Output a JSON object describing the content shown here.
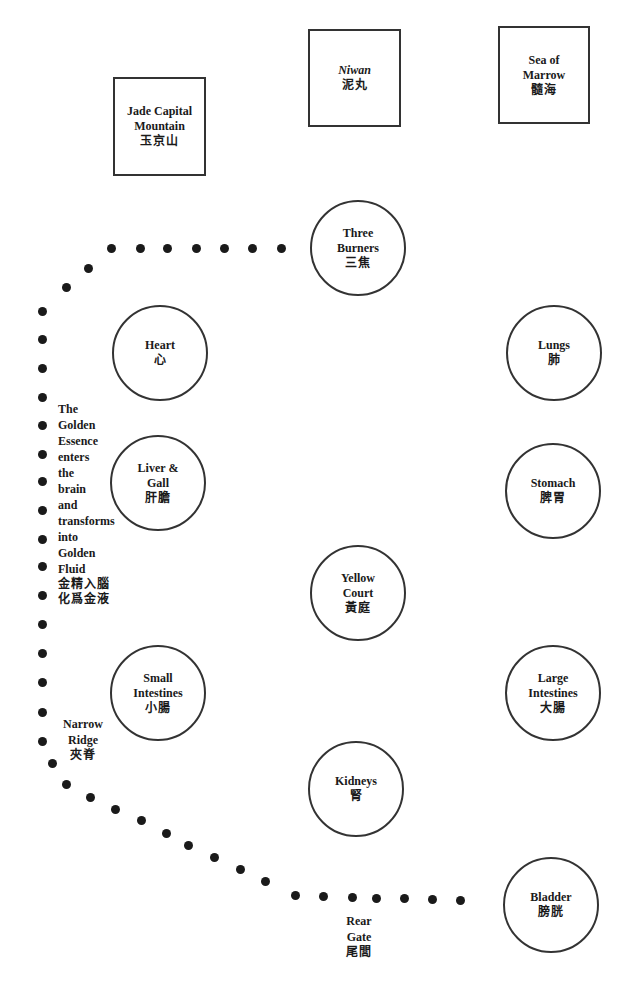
{
  "boxes": {
    "jade_capital": {
      "en": [
        "Jade Capital",
        "Mountain"
      ],
      "zh": "玉京山"
    },
    "niwan": {
      "en": [
        "Niwan"
      ],
      "zh": "泥丸"
    },
    "sea_of_marrow": {
      "en": [
        "Sea of",
        "Marrow"
      ],
      "zh": "髓海"
    }
  },
  "organs": {
    "three_burners": {
      "en": [
        "Three",
        "Burners"
      ],
      "zh": "三焦"
    },
    "heart": {
      "en": [
        "Heart"
      ],
      "zh": "心"
    },
    "lungs": {
      "en": [
        "Lungs"
      ],
      "zh": "肺"
    },
    "liver_gall": {
      "en": [
        "Liver &",
        "Gall"
      ],
      "zh": "肝膽"
    },
    "stomach": {
      "en": [
        "Stomach"
      ],
      "zh": "脾胃"
    },
    "yellow_court": {
      "en": [
        "Yellow",
        "Court"
      ],
      "zh": "黃庭"
    },
    "small_intestines": {
      "en": [
        "Small",
        "Intestines"
      ],
      "zh": "小腸"
    },
    "large_intestines": {
      "en": [
        "Large",
        "Intestines"
      ],
      "zh": "大腸"
    },
    "kidneys": {
      "en": [
        "Kidneys"
      ],
      "zh": "腎"
    },
    "bladder": {
      "en": [
        "Bladder"
      ],
      "zh": "膀胱"
    }
  },
  "annotations": {
    "golden_essence": {
      "lines": [
        "The",
        "Golden",
        "Essence",
        "enters",
        "the",
        "brain",
        "and",
        "transforms",
        "into",
        "Golden",
        "Fluid"
      ],
      "zh": [
        "金精入腦",
        "化爲金液"
      ]
    },
    "narrow_ridge": {
      "lines": [
        "Narrow",
        "Ridge"
      ],
      "zh": "夾脊"
    },
    "rear_gate": {
      "lines": [
        "Rear",
        "Gate"
      ],
      "zh": "尾閭"
    }
  },
  "path_dots": [
    [
      460,
      900
    ],
    [
      432,
      899
    ],
    [
      404,
      898
    ],
    [
      376,
      898
    ],
    [
      352,
      897
    ],
    [
      323,
      896
    ],
    [
      295,
      895
    ],
    [
      265,
      881
    ],
    [
      240,
      869
    ],
    [
      214,
      857
    ],
    [
      188,
      845
    ],
    [
      166,
      833
    ],
    [
      141,
      820
    ],
    [
      115,
      809
    ],
    [
      90,
      797
    ],
    [
      66,
      784
    ],
    [
      52,
      763
    ],
    [
      42,
      741
    ],
    [
      42,
      712
    ],
    [
      42,
      682
    ],
    [
      42,
      653
    ],
    [
      42,
      624
    ],
    [
      42,
      595
    ],
    [
      42,
      566
    ],
    [
      42,
      539
    ],
    [
      42,
      510
    ],
    [
      42,
      481
    ],
    [
      42,
      454
    ],
    [
      42,
      425
    ],
    [
      42,
      397
    ],
    [
      42,
      368
    ],
    [
      42,
      339
    ],
    [
      42,
      311
    ],
    [
      66,
      287
    ],
    [
      88,
      268
    ],
    [
      111,
      248
    ],
    [
      140,
      248
    ],
    [
      167,
      248
    ],
    [
      196,
      248
    ],
    [
      224,
      248
    ],
    [
      252,
      248
    ],
    [
      281,
      248
    ]
  ]
}
